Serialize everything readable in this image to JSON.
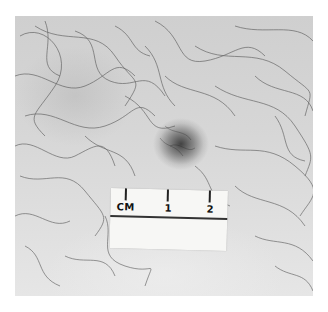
{
  "image": {
    "description": "Clinical photograph of a dark pigmented skin lesion on hairy skin with a centimeter scale",
    "lesion_color": "#3a3a3a",
    "skin_color": "#d6d6d6"
  },
  "ruler": {
    "unit_label": "CM",
    "ticks": [
      "1",
      "2"
    ]
  }
}
